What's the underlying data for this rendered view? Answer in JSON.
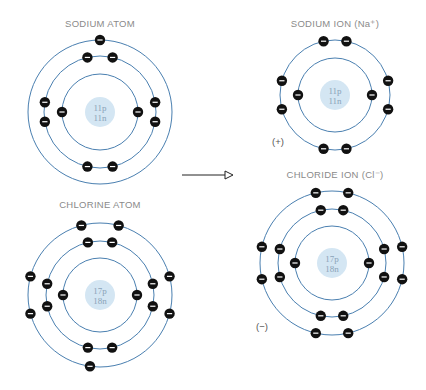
{
  "colors": {
    "orbit": "#4a7fb0",
    "nucleus": "#d4e6f3",
    "electron": "#111111",
    "text": "#8a8a8a",
    "nucleus_text": "#8aa3b8"
  },
  "arrow": {
    "from": [
      182,
      175
    ],
    "to": [
      233,
      175
    ]
  },
  "atoms": [
    {
      "id": "sodium-atom",
      "title": "SODIUM ATOM",
      "title_pos": [
        100,
        26
      ],
      "center": [
        100,
        112
      ],
      "nucleus_r": 15,
      "protons": "11p",
      "neutrons": "11n",
      "shells": [
        {
          "r": 38,
          "electrons": [
            180,
            0
          ]
        },
        {
          "r": 56,
          "electrons": [
            103,
            77,
            170,
            190,
            257,
            283,
            350,
            10
          ]
        },
        {
          "r": 72,
          "electrons": [
            90
          ]
        }
      ],
      "charge": ""
    },
    {
      "id": "chlorine-atom",
      "title": "CHLORINE ATOM",
      "title_pos": [
        100,
        207
      ],
      "center": [
        100,
        295
      ],
      "nucleus_r": 15,
      "protons": "17p",
      "neutrons": "18n",
      "shells": [
        {
          "r": 37,
          "electrons": [
            180,
            0
          ]
        },
        {
          "r": 54,
          "electrons": [
            103,
            77,
            168,
            192,
            257,
            283,
            348,
            12
          ]
        },
        {
          "r": 72,
          "electrons": [
            262,
            165,
            195,
            105,
            75,
            345,
            15
          ]
        }
      ],
      "charge": ""
    },
    {
      "id": "sodium-ion",
      "title": "SODIUM ION (Na⁺)",
      "title_pos": [
        335,
        26
      ],
      "center": [
        335,
        95
      ],
      "nucleus_r": 15,
      "protons": "11p",
      "neutrons": "11n",
      "shells": [
        {
          "r": 37,
          "electrons": [
            180,
            0
          ]
        },
        {
          "r": 55,
          "electrons": [
            102,
            78,
            165,
            195,
            258,
            282,
            345,
            15
          ]
        }
      ],
      "charge": "(+)",
      "charge_pos": [
        272,
        143
      ]
    },
    {
      "id": "chloride-ion",
      "title": "CHLORIDE ION (Cl⁻)",
      "title_pos": [
        335,
        177
      ],
      "center": [
        332,
        263
      ],
      "nucleus_r": 15,
      "protons": "17p",
      "neutrons": "18n",
      "shells": [
        {
          "r": 37,
          "electrons": [
            180,
            0
          ]
        },
        {
          "r": 54,
          "electrons": [
            102,
            78,
            165,
            195,
            258,
            282,
            345,
            15
          ]
        },
        {
          "r": 72,
          "electrons": [
            103,
            77,
            167,
            193,
            257,
            283,
            347,
            13
          ]
        }
      ],
      "charge": "(−)",
      "charge_pos": [
        256,
        328
      ]
    }
  ]
}
